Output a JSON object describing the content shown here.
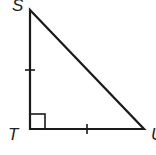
{
  "diagram": {
    "type": "right-triangle",
    "vertices": [
      {
        "label": "S",
        "x": 30,
        "y": 10
      },
      {
        "label": "T",
        "x": 30,
        "y": 129
      },
      {
        "label": "U",
        "x": 144,
        "y": 129
      }
    ],
    "right_angle_at": "T",
    "congruent_sides": [
      "ST",
      "TU"
    ],
    "tick_marks": 1,
    "colors": {
      "stroke": "#1a1a1a",
      "background": "#ffffff"
    }
  }
}
